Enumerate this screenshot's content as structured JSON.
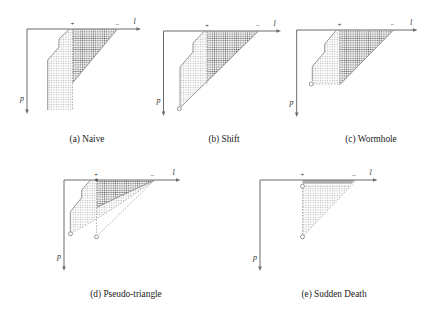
{
  "figure": {
    "diagrams": [
      {
        "caption": "(a) Naive",
        "h_axis_label": "l",
        "v_axis_label": "p",
        "plus_label": "+",
        "minus_label": "−"
      },
      {
        "caption": "(b) Shift",
        "h_axis_label": "l",
        "v_axis_label": "p",
        "plus_label": "+",
        "minus_label": "−"
      },
      {
        "caption": "(c) Wormhole",
        "h_axis_label": "l",
        "v_axis_label": "p",
        "plus_label": "+",
        "minus_label": "−"
      },
      {
        "caption": "(d) Pseudo-triangle",
        "h_axis_label": "l",
        "v_axis_label": "p",
        "plus_label": "+",
        "minus_label": "−"
      },
      {
        "caption": "(e) Sudden Death",
        "h_axis_label": "l",
        "v_axis_label": "p",
        "plus_label": "+",
        "minus_label": "−"
      }
    ],
    "colors": {
      "dark_region_dot": "#5f5f5f",
      "light_region_dot": "#b8b8b8",
      "strip": "#b0b0b0",
      "line": "#8c8c8c",
      "axis": "#6b6b6b",
      "text": "#1a1a1a"
    }
  }
}
